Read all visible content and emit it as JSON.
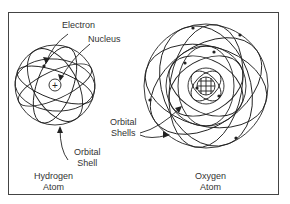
{
  "figure": {
    "hydrogen": {
      "labels": {
        "electron": "Electron",
        "nucleus": "Nucleus",
        "orbital_shell_line1": "Orbital",
        "orbital_shell_line2": "Shell",
        "title_line1": "Hydrogen",
        "title_line2": "Atom"
      },
      "nucleus_symbol": "+",
      "electron_symbol": "-"
    },
    "oxygen": {
      "labels": {
        "orbital_shells_line1": "Orbital",
        "orbital_shells_line2": "Shells",
        "title_line1": "Oxygen",
        "title_line2": "Atom"
      }
    },
    "colors": {
      "line": "#222222",
      "text": "#333333",
      "background": "#ffffff"
    }
  }
}
